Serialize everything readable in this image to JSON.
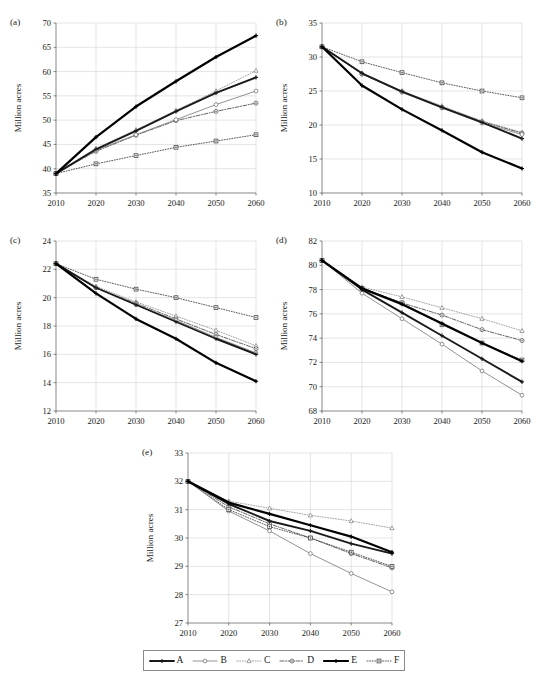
{
  "figure": {
    "axis_y_title": "Million acres",
    "x_tick_labels": [
      "2010",
      "2020",
      "2030",
      "2040",
      "2050",
      "2060"
    ],
    "x_values": [
      2010,
      2020,
      2030,
      2040,
      2050,
      2060
    ]
  },
  "legend": {
    "items": [
      {
        "label": "A",
        "marker": "plus",
        "dash": "solid",
        "width": 1.9,
        "color": "#1a1a1a"
      },
      {
        "label": "B",
        "marker": "circle-open",
        "dash": "solid",
        "width": 0.8,
        "color": "#777777"
      },
      {
        "label": "C",
        "marker": "triangle-open",
        "dash": "dotted",
        "width": 0.8,
        "color": "#8c8c8c"
      },
      {
        "label": "D",
        "marker": "circle-dot",
        "dash": "dashdot",
        "width": 0.9,
        "color": "#555555"
      },
      {
        "label": "E",
        "marker": "plus",
        "dash": "solid",
        "width": 2.2,
        "color": "#000000"
      },
      {
        "label": "F",
        "marker": "square-dot",
        "dash": "dotted",
        "width": 0.9,
        "color": "#4a4a4a"
      }
    ]
  },
  "chart_data": [
    {
      "id": "a",
      "type": "line",
      "tag": "(a)",
      "title": "",
      "xlabel": "",
      "ylabel": "Million acres",
      "x": [
        2010,
        2020,
        2030,
        2040,
        2050,
        2060
      ],
      "xlim": [
        2010,
        2060
      ],
      "ylim": [
        35,
        70
      ],
      "yticks": [
        35,
        40,
        45,
        50,
        55,
        60,
        65,
        70
      ],
      "grid": true,
      "legend_position": "external-bottom",
      "series": [
        {
          "name": "A",
          "values": [
            39.0,
            44.0,
            47.8,
            51.8,
            55.6,
            58.8
          ]
        },
        {
          "name": "B",
          "values": [
            39.0,
            43.8,
            47.0,
            50.1,
            53.2,
            56.0
          ]
        },
        {
          "name": "C",
          "values": [
            39.0,
            44.2,
            48.0,
            52.0,
            56.0,
            60.2
          ]
        },
        {
          "name": "D",
          "values": [
            39.0,
            43.6,
            46.9,
            49.9,
            51.8,
            53.5
          ]
        },
        {
          "name": "E",
          "values": [
            39.0,
            46.5,
            52.8,
            58.0,
            63.0,
            67.4
          ]
        },
        {
          "name": "F",
          "values": [
            39.0,
            41.0,
            42.7,
            44.4,
            45.7,
            47.0
          ]
        }
      ]
    },
    {
      "id": "b",
      "type": "line",
      "tag": "(b)",
      "title": "",
      "xlabel": "",
      "ylabel": "Million acres",
      "x": [
        2010,
        2020,
        2030,
        2040,
        2050,
        2060
      ],
      "xlim": [
        2010,
        2060
      ],
      "ylim": [
        10,
        35
      ],
      "yticks": [
        10,
        15,
        20,
        25,
        30,
        35
      ],
      "grid": true,
      "legend_position": "external-bottom",
      "series": [
        {
          "name": "A",
          "values": [
            31.5,
            27.6,
            24.9,
            22.6,
            20.4,
            18.0
          ]
        },
        {
          "name": "B",
          "values": [
            31.5,
            27.5,
            24.8,
            22.5,
            20.3,
            18.6
          ]
        },
        {
          "name": "C",
          "values": [
            31.5,
            27.6,
            25.0,
            22.8,
            20.6,
            18.9
          ]
        },
        {
          "name": "D",
          "values": [
            31.5,
            27.5,
            24.9,
            22.6,
            20.5,
            18.8
          ]
        },
        {
          "name": "E",
          "values": [
            31.5,
            25.8,
            22.3,
            19.2,
            16.0,
            13.6
          ]
        },
        {
          "name": "F",
          "values": [
            31.5,
            29.3,
            27.7,
            26.2,
            25.0,
            24.0
          ]
        }
      ]
    },
    {
      "id": "c",
      "type": "line",
      "tag": "(c)",
      "title": "",
      "xlabel": "",
      "ylabel": "Million acres",
      "x": [
        2010,
        2020,
        2030,
        2040,
        2050,
        2060
      ],
      "xlim": [
        2010,
        2060
      ],
      "ylim": [
        12,
        24
      ],
      "yticks": [
        12,
        14,
        16,
        18,
        20,
        22,
        24
      ],
      "grid": true,
      "legend_position": "external-bottom",
      "series": [
        {
          "name": "A",
          "values": [
            22.4,
            20.7,
            19.5,
            18.3,
            17.1,
            16.0
          ]
        },
        {
          "name": "B",
          "values": [
            22.4,
            20.7,
            19.5,
            18.4,
            17.2,
            16.1
          ]
        },
        {
          "name": "C",
          "values": [
            22.4,
            20.8,
            19.7,
            18.7,
            17.7,
            16.6
          ]
        },
        {
          "name": "D",
          "values": [
            22.4,
            20.7,
            19.6,
            18.5,
            17.4,
            16.4
          ]
        },
        {
          "name": "E",
          "values": [
            22.4,
            20.3,
            18.5,
            17.1,
            15.4,
            14.1
          ]
        },
        {
          "name": "F",
          "values": [
            22.4,
            21.3,
            20.6,
            20.0,
            19.3,
            18.6
          ]
        }
      ]
    },
    {
      "id": "d",
      "type": "line",
      "tag": "(d)",
      "title": "",
      "xlabel": "",
      "ylabel": "Million acres",
      "x": [
        2010,
        2020,
        2030,
        2040,
        2050,
        2060
      ],
      "xlim": [
        2010,
        2060
      ],
      "ylim": [
        68,
        82
      ],
      "yticks": [
        68,
        70,
        72,
        74,
        76,
        78,
        80,
        82
      ],
      "grid": true,
      "legend_position": "external-bottom",
      "series": [
        {
          "name": "A",
          "values": [
            80.4,
            78.0,
            76.1,
            74.2,
            72.3,
            70.4
          ]
        },
        {
          "name": "B",
          "values": [
            80.4,
            77.7,
            75.6,
            73.5,
            71.3,
            69.3
          ]
        },
        {
          "name": "C",
          "values": [
            80.4,
            78.2,
            77.4,
            76.5,
            75.6,
            74.6
          ]
        },
        {
          "name": "D",
          "values": [
            80.4,
            78.1,
            76.9,
            75.9,
            74.7,
            73.8
          ]
        },
        {
          "name": "E",
          "values": [
            80.4,
            78.1,
            76.8,
            75.2,
            73.6,
            72.1
          ]
        },
        {
          "name": "F",
          "values": [
            80.4,
            78.1,
            76.9,
            75.1,
            73.6,
            72.2
          ]
        }
      ]
    },
    {
      "id": "e",
      "type": "line",
      "tag": "(e)",
      "title": "",
      "xlabel": "",
      "ylabel": "Million acres",
      "x": [
        2010,
        2020,
        2030,
        2040,
        2050,
        2060
      ],
      "xlim": [
        2010,
        2060
      ],
      "ylim": [
        27,
        33
      ],
      "yticks": [
        27,
        28,
        29,
        30,
        31,
        32,
        33
      ],
      "grid": true,
      "legend_position": "external-bottom",
      "series": [
        {
          "name": "A",
          "values": [
            32.0,
            31.2,
            30.6,
            30.25,
            29.8,
            29.45
          ]
        },
        {
          "name": "B",
          "values": [
            32.0,
            30.95,
            30.25,
            29.45,
            28.75,
            28.1
          ]
        },
        {
          "name": "C",
          "values": [
            32.0,
            31.3,
            31.05,
            30.8,
            30.6,
            30.35
          ]
        },
        {
          "name": "D",
          "values": [
            32.0,
            31.1,
            30.5,
            30.0,
            29.45,
            28.95
          ]
        },
        {
          "name": "E",
          "values": [
            32.0,
            31.25,
            30.85,
            30.45,
            30.05,
            29.5
          ]
        },
        {
          "name": "F",
          "values": [
            32.0,
            31.0,
            30.4,
            30.0,
            29.5,
            29.0
          ]
        }
      ]
    }
  ]
}
